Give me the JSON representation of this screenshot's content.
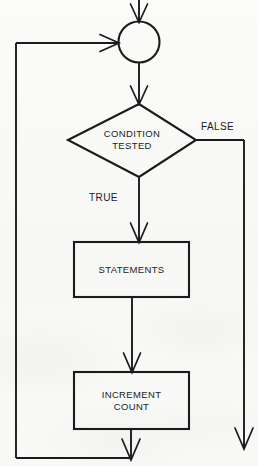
{
  "diagram": {
    "type": "flowchart",
    "width": 258,
    "height": 466,
    "background_color": "#f9f9f7",
    "stroke_color": "#1b1b1b",
    "text_color": "#1b1b1b"
  },
  "nodes": {
    "entry_connector": {
      "shape": "circle",
      "label": "",
      "cx": 139,
      "cy": 42,
      "r": 21
    },
    "decision": {
      "shape": "diamond",
      "label": "CONDITION\nTESTED",
      "cx": 132,
      "cy": 140,
      "half_width": 64,
      "half_height": 37
    },
    "statements": {
      "shape": "rectangle",
      "label": "STATEMENTS",
      "x": 74,
      "y": 242,
      "width": 115,
      "height": 55
    },
    "increment": {
      "shape": "rectangle",
      "label": "INCREMENT\nCOUNT",
      "x": 74,
      "y": 372,
      "width": 115,
      "height": 57
    }
  },
  "edge_labels": {
    "true_branch": "TRUE",
    "false_branch": "FALSE"
  },
  "ghost_text": [
    "",
    "",
    "",
    "",
    "",
    ""
  ]
}
